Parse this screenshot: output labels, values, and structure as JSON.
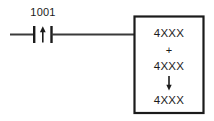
{
  "diagram": {
    "kind": "ladder-logic-rung",
    "background_color": "#ffffff",
    "line_color": "#1b1b1b",
    "wire_color": "#3a3a3a"
  },
  "rung": {
    "contact": {
      "label": "1001",
      "type": "positive-transition-contact",
      "symbol": "↑"
    }
  },
  "function_block": {
    "operand_1": "4XXX",
    "operator": "+",
    "operand_2": "4XXX",
    "result_arrow": "↓",
    "result": "4XXX"
  }
}
